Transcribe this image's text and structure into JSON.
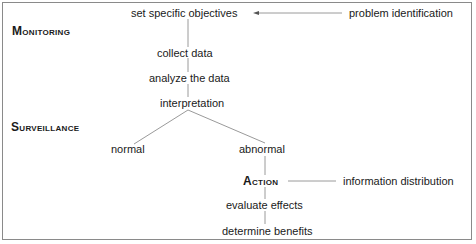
{
  "diagram": {
    "section_labels": {
      "monitoring": "Monitoring",
      "surveillance": "Surveillance"
    },
    "nodes": {
      "set_objectives": "set specific objectives",
      "problem_identification": "problem identification",
      "collect_data": "collect data",
      "analyze_data": "analyze the data",
      "interpretation": "interpretation",
      "normal": "normal",
      "abnormal": "abnormal",
      "action": "Action",
      "information_distribution": "information distribution",
      "evaluate_effects": "evaluate effects",
      "determine_benefits": "determine benefits"
    },
    "edges": [
      {
        "from": "problem_identification",
        "to": "set_objectives",
        "arrow": true
      },
      {
        "from": "set_objectives",
        "to": "collect_data"
      },
      {
        "from": "collect_data",
        "to": "analyze_data"
      },
      {
        "from": "analyze_data",
        "to": "interpretation"
      },
      {
        "from": "interpretation",
        "to": "normal"
      },
      {
        "from": "interpretation",
        "to": "abnormal"
      },
      {
        "from": "abnormal",
        "to": "action"
      },
      {
        "from": "action",
        "to": "information_distribution"
      },
      {
        "from": "action",
        "to": "evaluate_effects"
      },
      {
        "from": "evaluate_effects",
        "to": "determine_benefits"
      }
    ]
  }
}
